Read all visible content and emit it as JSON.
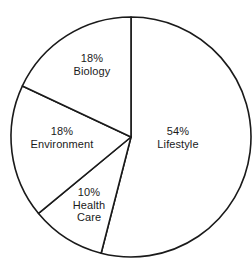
{
  "chart_data": {
    "type": "pie",
    "title": "",
    "subtitle": "",
    "xlabel": "",
    "ylabel": "",
    "legend": "none",
    "grid": false,
    "units": "percent",
    "total": 100,
    "start_angle_deg": 0,
    "direction": "clockwise",
    "categories": [
      "Lifestyle",
      "Health Care",
      "Environment",
      "Biology"
    ],
    "values": [
      54,
      10,
      18,
      18
    ],
    "slices": [
      {
        "name": "Lifestyle",
        "value": 54,
        "percent_label": "54%",
        "start_deg": 0,
        "end_deg": 194.4,
        "label_x": 178,
        "label_y": 137
      },
      {
        "name": "Health Care",
        "value": 10,
        "percent_label": "10%",
        "start_deg": 194.4,
        "end_deg": 230.4,
        "label_x": 89,
        "label_y": 205
      },
      {
        "name": "Environment",
        "value": 18,
        "percent_label": "18%",
        "start_deg": 230.4,
        "end_deg": 295.2,
        "label_x": 62,
        "label_y": 137
      },
      {
        "name": "Biology",
        "value": 18,
        "percent_label": "18%",
        "start_deg": 295.2,
        "end_deg": 360,
        "label_x": 92,
        "label_y": 64
      }
    ],
    "geometry": {
      "center_x": 131,
      "center_y": 137,
      "radius": 120
    },
    "style": {
      "fill": "#ffffff",
      "stroke": "#1a1a1a",
      "background": "#ffffff",
      "text_color": "#1a1a1a"
    }
  }
}
